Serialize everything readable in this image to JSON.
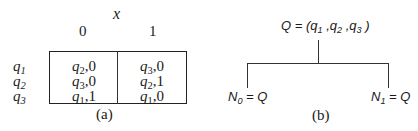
{
  "panel_a": {
    "column_variable": "x",
    "columns": [
      "0",
      "1"
    ],
    "rows": [
      {
        "state": "q",
        "state_sub": "1",
        "cells": [
          {
            "q": "q",
            "sub": "2",
            "out": ",0"
          },
          {
            "q": "q",
            "sub": "3",
            "out": ",0"
          }
        ]
      },
      {
        "state": "q",
        "state_sub": "2",
        "cells": [
          {
            "q": "q",
            "sub": "3",
            "out": ",0"
          },
          {
            "q": "q",
            "sub": "2",
            "out": ",1"
          }
        ]
      },
      {
        "state": "q",
        "state_sub": "3",
        "cells": [
          {
            "q": "q",
            "sub": "1",
            "out": ",1"
          },
          {
            "q": "q",
            "sub": "1",
            "out": ",0"
          }
        ]
      }
    ],
    "caption": "(a)"
  },
  "panel_b": {
    "root": {
      "prefix": "Q = (q",
      "s1": "1",
      "m1": " ,q",
      "s2": "2",
      "m2": " ,q",
      "s3": "3",
      "suffix": " )"
    },
    "left_leaf": {
      "name": "N",
      "sub": "0",
      "rest": " = Q"
    },
    "right_leaf": {
      "name": "N",
      "sub": "1",
      "rest": " = Q"
    },
    "caption": "(b)"
  }
}
